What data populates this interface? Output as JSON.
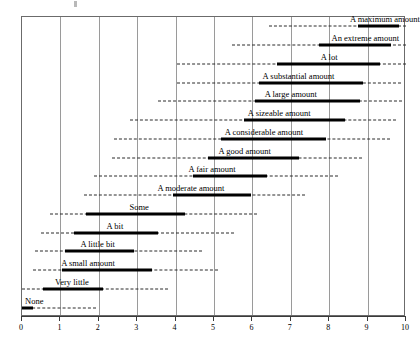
{
  "chart_data": {
    "type": "bar",
    "title": "",
    "subtitle": "",
    "xlabel": "",
    "ylabel": "",
    "xlim": [
      0,
      10
    ],
    "ylim": [
      0,
      16
    ],
    "grid": true,
    "legend": false,
    "legend_position": "none",
    "x_ticks": [
      "0",
      "1",
      "2",
      "3",
      "4",
      "5",
      "6",
      "7",
      "8",
      "9",
      "10"
    ],
    "x_tick_values": [
      0,
      1,
      2,
      3,
      4,
      5,
      6,
      7,
      8,
      9,
      10
    ],
    "orientation": "horizontal",
    "categories": [
      "A maximum amount",
      "An extreme amount",
      "A lot",
      "A substantial amount",
      "A large amount",
      "A sizeable amount",
      "A considerable amount",
      "A good amount",
      "A fair amount",
      "A moderate amount",
      "Some",
      "A bit",
      "A little bit",
      "A small amount",
      "Very little",
      "None"
    ],
    "series": [
      {
        "name": "box-low",
        "values": [
          8.75,
          7.73,
          6.64,
          6.17,
          6.07,
          5.78,
          5.18,
          4.84,
          4.45,
          3.93,
          1.67,
          1.35,
          1.12,
          1.04,
          0.55,
          0.0
        ]
      },
      {
        "name": "box-high",
        "values": [
          9.82,
          9.61,
          9.32,
          8.88,
          8.8,
          8.41,
          7.92,
          7.21,
          6.38,
          5.96,
          4.25,
          3.54,
          2.92,
          3.39,
          2.11,
          0.29
        ]
      },
      {
        "name": "whisker-low",
        "values": [
          6.43,
          5.47,
          4.04,
          4.04,
          3.55,
          2.82,
          2.4,
          2.34,
          1.87,
          1.62,
          0.73,
          0.49,
          0.33,
          0.29,
          0.0,
          0.0
        ]
      },
      {
        "name": "whisker-high",
        "values": [
          10.0,
          10.0,
          10.0,
          9.88,
          9.9,
          9.73,
          9.59,
          8.86,
          8.22,
          7.37,
          6.12,
          5.53,
          4.69,
          5.1,
          3.8,
          1.93
        ]
      }
    ],
    "rows": [
      {
        "label": "A maximum amount",
        "box_low": 8.75,
        "box_high": 9.82,
        "whisker_low": 6.43,
        "whisker_high": 10.0,
        "label_center": 9.45
      },
      {
        "label": "An extreme amount",
        "box_low": 7.73,
        "box_high": 9.61,
        "whisker_low": 5.47,
        "whisker_high": 10.0,
        "label_center": 8.94
      },
      {
        "label": "A lot",
        "box_low": 6.64,
        "box_high": 9.32,
        "whisker_low": 4.04,
        "whisker_high": 10.0,
        "label_center": 8.0
      },
      {
        "label": "A substantial amount",
        "box_low": 6.17,
        "box_high": 8.88,
        "whisker_low": 4.04,
        "whisker_high": 9.88,
        "label_center": 7.2
      },
      {
        "label": "A large amount",
        "box_low": 6.07,
        "box_high": 8.8,
        "whisker_low": 3.55,
        "whisker_high": 9.9,
        "label_center": 7.0
      },
      {
        "label": "A sizeable amount",
        "box_low": 5.78,
        "box_high": 8.41,
        "whisker_low": 2.82,
        "whisker_high": 9.73,
        "label_center": 6.7
      },
      {
        "label": "A considerable amount",
        "box_low": 5.18,
        "box_high": 7.92,
        "whisker_low": 2.4,
        "whisker_high": 9.59,
        "label_center": 6.3
      },
      {
        "label": "A good amount",
        "box_low": 4.84,
        "box_high": 7.21,
        "whisker_low": 2.34,
        "whisker_high": 8.86,
        "label_center": 5.8
      },
      {
        "label": "A fair amount",
        "box_low": 4.45,
        "box_high": 6.38,
        "whisker_low": 1.87,
        "whisker_high": 8.22,
        "label_center": 4.95
      },
      {
        "label": "A moderate amount",
        "box_low": 3.93,
        "box_high": 5.96,
        "whisker_low": 1.62,
        "whisker_high": 7.37,
        "label_center": 4.4
      },
      {
        "label": "Some",
        "box_low": 1.67,
        "box_high": 4.25,
        "whisker_low": 0.73,
        "whisker_high": 6.12,
        "label_center": 3.05
      },
      {
        "label": "A bit",
        "box_low": 1.35,
        "box_high": 3.54,
        "whisker_low": 0.49,
        "whisker_high": 5.53,
        "label_center": 2.42
      },
      {
        "label": "A little bit",
        "box_low": 1.12,
        "box_high": 2.92,
        "whisker_low": 0.33,
        "whisker_high": 4.69,
        "label_center": 1.97
      },
      {
        "label": "A small amount",
        "box_low": 1.04,
        "box_high": 3.39,
        "whisker_low": 0.29,
        "whisker_high": 5.1,
        "label_center": 1.72
      },
      {
        "label": "Very little",
        "box_low": 0.55,
        "box_high": 2.11,
        "whisker_low": 0.0,
        "whisker_high": 3.8,
        "label_center": 1.3
      },
      {
        "label": "None",
        "box_low": 0.0,
        "box_high": 0.29,
        "whisker_low": 0.0,
        "whisker_high": 1.93,
        "label_center": 0.32
      }
    ],
    "colors": {
      "box": "#000000",
      "whisker": "#2b2b2b",
      "grid": "#9a9a9a",
      "axis": "#3a3a3a",
      "background": "#ffffff"
    }
  }
}
